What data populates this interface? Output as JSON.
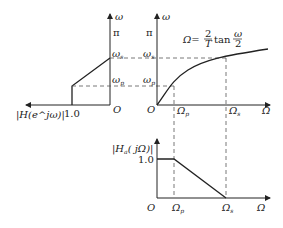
{
  "diagram": {
    "colors": {
      "line": "#222222",
      "dash": "#555555",
      "background": "#ffffff"
    },
    "left_panel": {
      "x_axis_label": "|H(e^jω)|",
      "y_axis_label": "ω",
      "origin_label": "O",
      "tick_x": "1.0",
      "tick_pi": "π",
      "tick_ws": "ω",
      "tick_ws_sub": "s",
      "tick_wp": "ω",
      "tick_wp_sub": "p"
    },
    "center_panel": {
      "y_axis_label": "ω",
      "x_axis_label": "Ω",
      "origin_label": "O",
      "tick_pi": "π",
      "tick_ws": "ω",
      "tick_ws_sub": "s",
      "tick_wp": "ω",
      "tick_wp_sub": "p",
      "tick_Op": "Ω",
      "tick_Op_sub": "p",
      "tick_Os": "Ω",
      "tick_Os_sub": "s",
      "formula_lhs": "Ω=",
      "formula_num": "2",
      "formula_den": "T",
      "formula_fn": "tan",
      "formula_arg_num": "ω",
      "formula_arg_den": "2"
    },
    "bottom_panel": {
      "y_axis_label": "|H",
      "y_axis_label_sub": "a",
      "y_axis_label_rest": "( jΩ)|",
      "x_axis_label": "Ω",
      "origin_label": "O",
      "tick_y": "1.0",
      "tick_Op": "Ω",
      "tick_Op_sub": "p",
      "tick_Os": "Ω",
      "tick_Os_sub": "s"
    }
  }
}
